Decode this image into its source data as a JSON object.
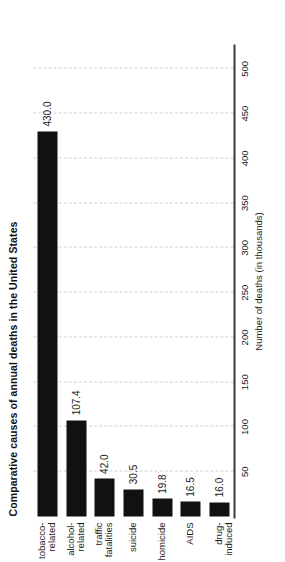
{
  "chart_data": {
    "type": "bar",
    "orientation": "horizontal",
    "title": "Comparative causes of annual deaths in the United States",
    "xlabel": "Number of deaths (in thousands)",
    "ylabel": "",
    "categories": [
      "tobacco-\nrelated",
      "alcohol-\nrelated",
      "traffic\nfatalities",
      "suicide",
      "homicide",
      "AIDS",
      "drug-induced"
    ],
    "values": [
      430.0,
      107.4,
      42.0,
      30.5,
      19.8,
      16.5,
      16.0
    ],
    "value_labels": [
      "430.0",
      "107.4",
      "42.0",
      "30.5",
      "19.8",
      "16.5",
      "16.0"
    ],
    "xlim": [
      0,
      525
    ],
    "ticks": [
      50,
      100,
      150,
      200,
      250,
      300,
      350,
      400,
      450,
      500
    ],
    "tick_labels": [
      "50",
      "100",
      "150",
      "200",
      "250",
      "300",
      "350",
      "400",
      "450",
      "500"
    ],
    "grid": true,
    "legend": false,
    "bar_color": "#111111",
    "grid_color": "#cfcfcf",
    "axis_color": "#3b3b3b",
    "text_color": "#1a1a1a"
  }
}
